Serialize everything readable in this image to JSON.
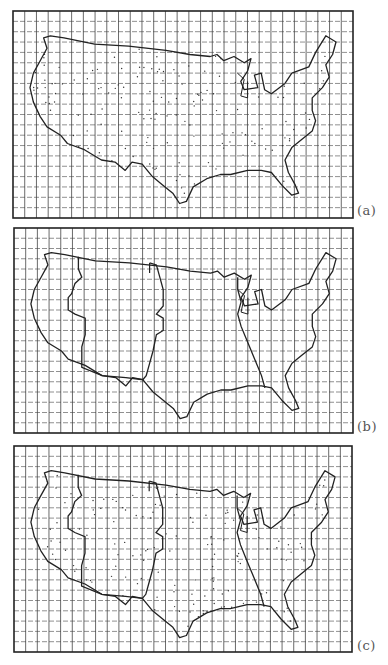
{
  "figure": {
    "panels": [
      {
        "id": "a",
        "label": "(a)",
        "top": 11,
        "left": 13,
        "width": 340,
        "height": 207,
        "label_x": 357,
        "label_y": 203,
        "show_west_region": false,
        "show_central_line": false,
        "show_dots": true
      },
      {
        "id": "b",
        "label": "(b)",
        "top": 228,
        "left": 14,
        "width": 339,
        "height": 205,
        "label_x": 357,
        "label_y": 419,
        "show_west_region": true,
        "show_central_line": true,
        "show_dots": false
      },
      {
        "id": "c",
        "label": "(c)",
        "top": 446,
        "left": 14,
        "width": 338,
        "height": 206,
        "label_x": 357,
        "label_y": 638,
        "show_west_region": true,
        "show_central_line": true,
        "show_dots": true
      }
    ],
    "grid": {
      "columns": 29,
      "rows": 20,
      "line_color": "#444444",
      "frame_color": "#222222"
    },
    "map": {
      "outline_color": "#222222",
      "subject": "contiguous United States outline on grid"
    }
  }
}
